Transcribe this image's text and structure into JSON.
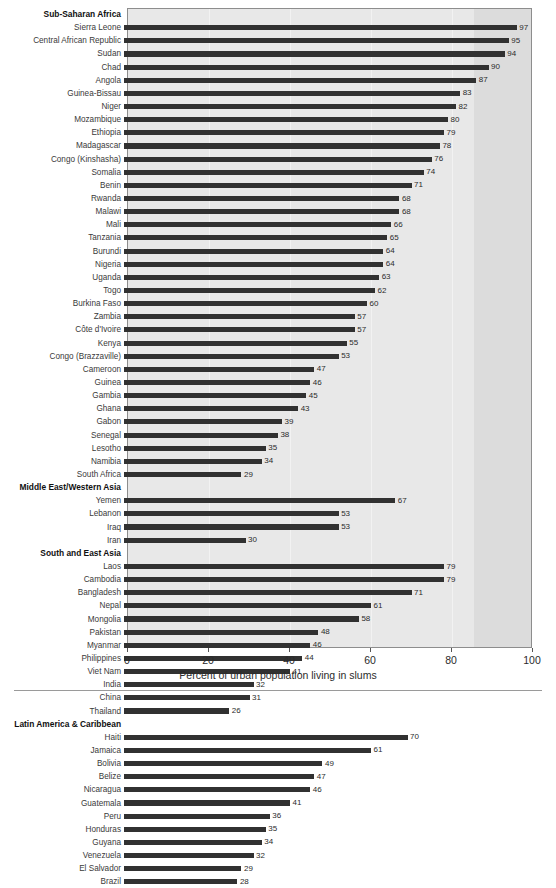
{
  "chart_data": {
    "type": "bar",
    "orientation": "horizontal",
    "title": "",
    "xlabel": "Percent of urban population living in slums",
    "ylabel": "",
    "xlim": [
      0,
      100
    ],
    "xticks": [
      0,
      20,
      40,
      60,
      80,
      100
    ],
    "grid": true,
    "legend": null,
    "bar_color": "#313131",
    "plot_background": "#e8e8e8",
    "shaded_band": [
      85.5,
      100
    ],
    "groups": [
      {
        "name": "Sub-Saharan Africa",
        "categories": [
          "Sierra Leone",
          "Central African Republic",
          "Sudan",
          "Chad",
          "Angola",
          "Guinea-Bissau",
          "Niger",
          "Mozambique",
          "Ethiopia",
          "Madagascar",
          "Congo (Kinshasha)",
          "Somalia",
          "Benin",
          "Rwanda",
          "Malawi",
          "Mali",
          "Tanzania",
          "Burundi",
          "Nigeria",
          "Uganda",
          "Togo",
          "Burkina Faso",
          "Zambia",
          "Côte d'Ivoire",
          "Kenya",
          "Congo (Brazzaville)",
          "Cameroon",
          "Guinea",
          "Gambia",
          "Ghana",
          "Gabon",
          "Senegal",
          "Lesotho",
          "Namibia",
          "South Africa"
        ],
        "values": [
          97,
          95,
          94,
          90,
          87,
          83,
          82,
          80,
          79,
          78,
          76,
          74,
          71,
          68,
          68,
          66,
          65,
          64,
          64,
          63,
          62,
          60,
          57,
          57,
          55,
          53,
          47,
          46,
          45,
          43,
          39,
          38,
          35,
          34,
          29
        ]
      },
      {
        "name": "Middle East/Western Asia",
        "categories": [
          "Yemen",
          "Lebanon",
          "Iraq",
          "Iran"
        ],
        "values": [
          67,
          53,
          53,
          30
        ]
      },
      {
        "name": "South and East Asia",
        "categories": [
          "Laos",
          "Cambodia",
          "Bangladesh",
          "Nepal",
          "Mongolia",
          "Pakistan",
          "Myanmar",
          "Philippines",
          "Viet Nam",
          "India",
          "China",
          "Thailand"
        ],
        "values": [
          79,
          79,
          71,
          61,
          58,
          48,
          46,
          44,
          41,
          32,
          31,
          26
        ]
      },
      {
        "name": "Latin America & Caribbean",
        "categories": [
          "Haiti",
          "Jamaica",
          "Bolivia",
          "Belize",
          "Nicaragua",
          "Guatemala",
          "Peru",
          "Honduras",
          "Guyana",
          "Venezuela",
          "El Salvador",
          "Brazil"
        ],
        "values": [
          70,
          61,
          49,
          47,
          46,
          41,
          36,
          35,
          34,
          32,
          29,
          28
        ]
      }
    ]
  }
}
